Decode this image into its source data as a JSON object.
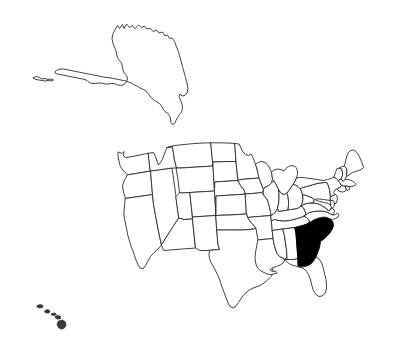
{
  "figure": {
    "type": "choropleth-locator-map",
    "title": "",
    "subtitle": "",
    "background_color": "#ffffff",
    "width": 396,
    "height": 353
  },
  "map": {
    "name": "united-states-map",
    "projection_style": "composite-with-insets",
    "border_color": "#2b2b2b",
    "default_fill": "#ffffff",
    "highlight_fill": "#000000",
    "legend": null,
    "labels_visible": false,
    "highlighted_states": [
      "Georgia",
      "South Carolina"
    ],
    "insets": [
      "Alaska",
      "Hawaii"
    ],
    "regions": [
      {
        "code": "WA",
        "name": "Washington",
        "highlighted": false
      },
      {
        "code": "OR",
        "name": "Oregon",
        "highlighted": false
      },
      {
        "code": "CA",
        "name": "California",
        "highlighted": false
      },
      {
        "code": "NV",
        "name": "Nevada",
        "highlighted": false
      },
      {
        "code": "ID",
        "name": "Idaho",
        "highlighted": false
      },
      {
        "code": "MT",
        "name": "Montana",
        "highlighted": false
      },
      {
        "code": "WY",
        "name": "Wyoming",
        "highlighted": false
      },
      {
        "code": "UT",
        "name": "Utah",
        "highlighted": false
      },
      {
        "code": "AZ",
        "name": "Arizona",
        "highlighted": false
      },
      {
        "code": "CO",
        "name": "Colorado",
        "highlighted": false
      },
      {
        "code": "NM",
        "name": "New Mexico",
        "highlighted": false
      },
      {
        "code": "ND",
        "name": "North Dakota",
        "highlighted": false
      },
      {
        "code": "SD",
        "name": "South Dakota",
        "highlighted": false
      },
      {
        "code": "NE",
        "name": "Nebraska",
        "highlighted": false
      },
      {
        "code": "KS",
        "name": "Kansas",
        "highlighted": false
      },
      {
        "code": "OK",
        "name": "Oklahoma",
        "highlighted": false
      },
      {
        "code": "TX",
        "name": "Texas",
        "highlighted": false
      },
      {
        "code": "MN",
        "name": "Minnesota",
        "highlighted": false
      },
      {
        "code": "IA",
        "name": "Iowa",
        "highlighted": false
      },
      {
        "code": "MO",
        "name": "Missouri",
        "highlighted": false
      },
      {
        "code": "AR",
        "name": "Arkansas",
        "highlighted": false
      },
      {
        "code": "LA",
        "name": "Louisiana",
        "highlighted": false
      },
      {
        "code": "WI",
        "name": "Wisconsin",
        "highlighted": false
      },
      {
        "code": "IL",
        "name": "Illinois",
        "highlighted": false
      },
      {
        "code": "MI",
        "name": "Michigan",
        "highlighted": false
      },
      {
        "code": "IN",
        "name": "Indiana",
        "highlighted": false
      },
      {
        "code": "OH",
        "name": "Ohio",
        "highlighted": false
      },
      {
        "code": "KY",
        "name": "Kentucky",
        "highlighted": false
      },
      {
        "code": "TN",
        "name": "Tennessee",
        "highlighted": false
      },
      {
        "code": "MS",
        "name": "Mississippi",
        "highlighted": false
      },
      {
        "code": "AL",
        "name": "Alabama",
        "highlighted": false
      },
      {
        "code": "FL",
        "name": "Florida",
        "highlighted": false
      },
      {
        "code": "GA",
        "name": "Georgia",
        "highlighted": true
      },
      {
        "code": "SC",
        "name": "South Carolina",
        "highlighted": true
      },
      {
        "code": "NC",
        "name": "North Carolina",
        "highlighted": false
      },
      {
        "code": "VA",
        "name": "Virginia",
        "highlighted": false
      },
      {
        "code": "WV",
        "name": "West Virginia",
        "highlighted": false
      },
      {
        "code": "MD",
        "name": "Maryland",
        "highlighted": false
      },
      {
        "code": "DE",
        "name": "Delaware",
        "highlighted": false
      },
      {
        "code": "PA",
        "name": "Pennsylvania",
        "highlighted": false
      },
      {
        "code": "NJ",
        "name": "New Jersey",
        "highlighted": false
      },
      {
        "code": "NY",
        "name": "New York",
        "highlighted": false
      },
      {
        "code": "CT",
        "name": "Connecticut",
        "highlighted": false
      },
      {
        "code": "RI",
        "name": "Rhode Island",
        "highlighted": false
      },
      {
        "code": "MA",
        "name": "Massachusetts",
        "highlighted": false
      },
      {
        "code": "VT",
        "name": "Vermont",
        "highlighted": false
      },
      {
        "code": "NH",
        "name": "New Hampshire",
        "highlighted": false
      },
      {
        "code": "ME",
        "name": "Maine",
        "highlighted": false
      },
      {
        "code": "AK",
        "name": "Alaska",
        "highlighted": false
      },
      {
        "code": "HI",
        "name": "Hawaii",
        "highlighted": false
      }
    ]
  }
}
